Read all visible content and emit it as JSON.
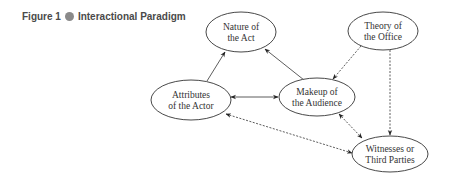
{
  "caption": {
    "figure_label": "Figure 1",
    "title": "Interactional Paradigm"
  },
  "nodes": {
    "nature": {
      "line1": "Nature of",
      "line2": "the Act"
    },
    "theory": {
      "line1": "Theory of",
      "line2": "the Office"
    },
    "attributes": {
      "line1": "Attributes",
      "line2": "of the Actor"
    },
    "makeup": {
      "line1": "Makeup of",
      "line2": "the Audience"
    },
    "witnesses": {
      "line1": "Witnesses or",
      "line2": "Third Parties"
    }
  },
  "edges": [
    {
      "from": "Attributes of the Actor",
      "to": "Nature of the Act",
      "style": "solid",
      "direction": "one-way"
    },
    {
      "from": "Makeup of the Audience",
      "to": "Nature of the Act",
      "style": "solid",
      "direction": "one-way"
    },
    {
      "from": "Attributes of the Actor",
      "to": "Makeup of the Audience",
      "style": "solid",
      "direction": "two-way"
    },
    {
      "from": "Theory of the Office",
      "to": "Makeup of the Audience",
      "style": "dashed",
      "direction": "one-way"
    },
    {
      "from": "Theory of the Office",
      "to": "Witnesses or Third Parties",
      "style": "dashed",
      "direction": "one-way"
    },
    {
      "from": "Makeup of the Audience",
      "to": "Witnesses or Third Parties",
      "style": "dashed",
      "direction": "two-way"
    },
    {
      "from": "Attributes of the Actor",
      "to": "Witnesses or Third Parties",
      "style": "dashed",
      "direction": "two-way"
    }
  ]
}
